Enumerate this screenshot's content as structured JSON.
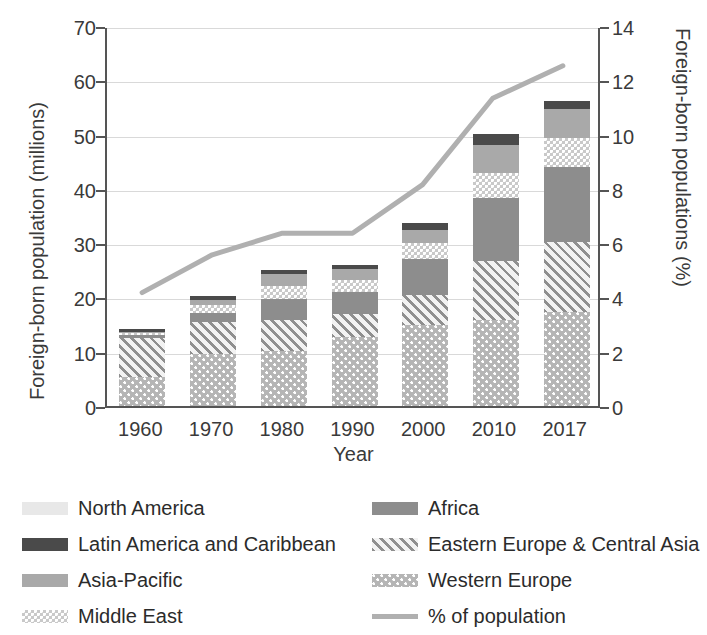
{
  "chart_data": {
    "type": "bar",
    "title": "",
    "subtitle": "",
    "xlabel": "Year",
    "ylabel": "Foreign-born population (millions)",
    "y2label": "Foreign-born populations (%)",
    "categories": [
      "1960",
      "1970",
      "1980",
      "1990",
      "2000",
      "2010",
      "2017"
    ],
    "ylim": [
      0,
      70
    ],
    "yticks": [
      "0",
      "10",
      "20",
      "30",
      "40",
      "50",
      "60",
      "70"
    ],
    "y2lim": [
      0,
      14
    ],
    "y2ticks": [
      "0",
      "2",
      "4",
      "6",
      "8",
      "10",
      "12",
      "14"
    ],
    "grid": true,
    "legend_position": "bottom",
    "stack_order_bottom_to_top": [
      "Western Europe",
      "Eastern Europe & Central Asia",
      "Africa",
      "Middle East",
      "Asia-Pacific",
      "Latin America and Caribbean",
      "North America"
    ],
    "series": [
      {
        "name": "Western Europe",
        "key": "west",
        "values": [
          5.3,
          9.6,
          10.1,
          12.8,
          15.0,
          15.9,
          17.4
        ]
      },
      {
        "name": "Eastern Europe & Central Asia",
        "key": "east",
        "values": [
          7.2,
          5.9,
          5.7,
          4.1,
          5.5,
          10.9,
          12.9
        ]
      },
      {
        "name": "Africa",
        "key": "africa",
        "values": [
          0.6,
          1.6,
          4.0,
          4.1,
          6.5,
          11.6,
          13.7
        ]
      },
      {
        "name": "Middle East",
        "key": "middle",
        "values": [
          0.4,
          1.6,
          2.4,
          2.2,
          3.1,
          4.6,
          5.3
        ]
      },
      {
        "name": "Asia-Pacific",
        "key": "asia",
        "values": [
          0.2,
          0.9,
          2.2,
          2.0,
          2.4,
          5.0,
          5.4
        ]
      },
      {
        "name": "Latin America and Caribbean",
        "key": "latin",
        "values": [
          0.5,
          0.7,
          0.7,
          0.7,
          1.2,
          2.2,
          1.5
        ]
      },
      {
        "name": "North America",
        "key": "north",
        "values": [
          0.0,
          0.0,
          0.0,
          0.0,
          0.0,
          0.0,
          0.0
        ]
      }
    ],
    "line_series": {
      "name": "% of population",
      "axis": "right",
      "color": "#b0b0b0",
      "values": [
        4.2,
        5.6,
        6.4,
        6.4,
        8.2,
        11.4,
        12.6
      ]
    }
  },
  "legend": {
    "left": [
      {
        "label": "North America",
        "key": "north"
      },
      {
        "label": "Latin America and Caribbean",
        "key": "latin"
      },
      {
        "label": "Asia-Pacific",
        "key": "asia"
      },
      {
        "label": "Middle East",
        "key": "middle"
      }
    ],
    "right": [
      {
        "label": "Africa",
        "key": "africa"
      },
      {
        "label": "Eastern Europe & Central Asia",
        "key": "east"
      },
      {
        "label": "Western Europe",
        "key": "west"
      },
      {
        "label": "% of population",
        "key": "line"
      }
    ]
  },
  "colors": {
    "north_america": "#e8e8e8",
    "latin_america": "#4a4a4a",
    "asia_pacific": "#a9a9a9",
    "middle_east": "#c9c9c9",
    "africa": "#8d8d8d",
    "eastern_europe": "#cfcfcf",
    "western_europe": "#b5b5b5",
    "line": "#b0b0b0",
    "axis": "#555555",
    "grid": "#d9d9d9"
  }
}
